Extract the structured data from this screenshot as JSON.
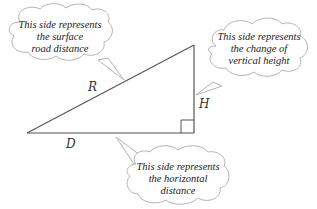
{
  "diagram": {
    "type": "right-triangle",
    "colors": {
      "line": "#555555",
      "cloud_stroke": "#aaaaaa",
      "cloud_fill": "#ffffff",
      "text": "#222222"
    },
    "sides": {
      "hypotenuse": {
        "label": "R"
      },
      "vertical": {
        "label": "H"
      },
      "horizontal": {
        "label": "D"
      }
    },
    "callouts": {
      "surface": {
        "line1": "This side represents",
        "line2": "the surface",
        "line3": "road distance"
      },
      "vertical": {
        "line1": "This side represents",
        "line2": "the change of",
        "line3": "vertical height"
      },
      "horizontal": {
        "line1": "This side represents",
        "line2": "the horizontal",
        "line3": "distance"
      }
    }
  }
}
